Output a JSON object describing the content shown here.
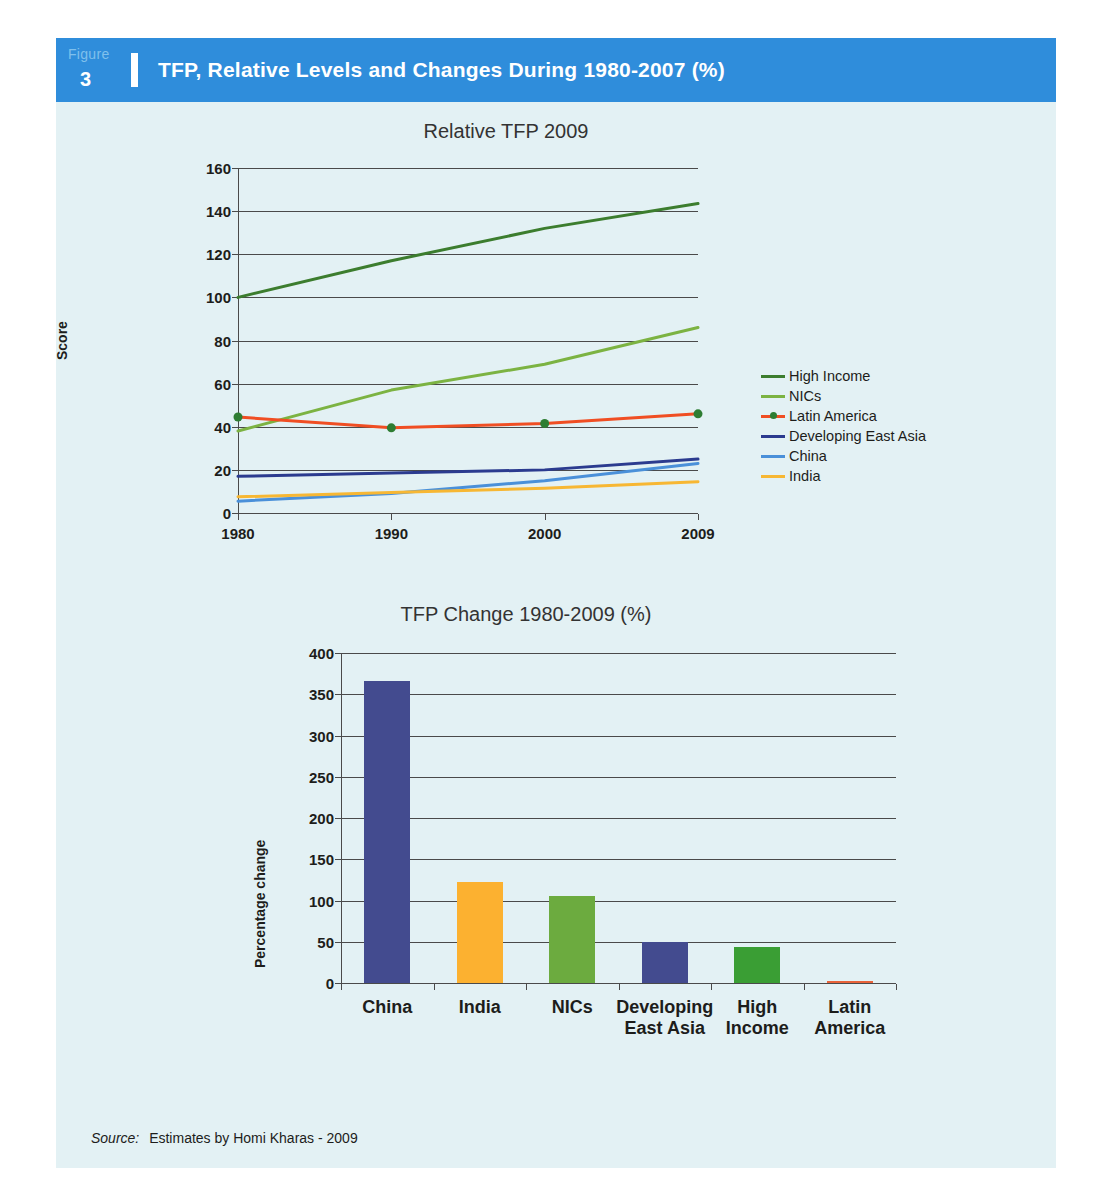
{
  "figure": {
    "label": "Figure",
    "number": "3",
    "title": "TFP, Relative Levels and Changes During 1980-2007 (%)"
  },
  "source": {
    "prefix": "Source:",
    "text": "Estimates by Homi Kharas - 2009"
  },
  "colors": {
    "header_blue": "#2f8ddb",
    "panel_bg": "#e3f1f4",
    "high_income": "#3c7d2e",
    "nics": "#7cb342",
    "latin_america": "#f04e23",
    "latin_america_marker": "#2e7d32",
    "developing_east_asia": "#2b3b8f",
    "china": "#4a90d9",
    "india": "#f7b733",
    "bar_china": "#434b8f",
    "bar_india": "#fcb130",
    "bar_nics": "#6cab3f",
    "bar_dev_east_asia": "#434b8f",
    "bar_high_income": "#3a9e34",
    "bar_latin_america": "#e8633a"
  },
  "chart_data": [
    {
      "type": "line",
      "title": "Relative TFP 2009",
      "xlabel": "",
      "ylabel": "Score",
      "x": [
        "1980",
        "1990",
        "2000",
        "2009"
      ],
      "ylim": [
        0,
        160
      ],
      "yticks": [
        0,
        20,
        40,
        60,
        80,
        100,
        120,
        140,
        160
      ],
      "grid": true,
      "legend_position": "right",
      "series": [
        {
          "name": "High Income",
          "values": [
            100,
            117,
            132,
            143.5
          ],
          "color": "#3c7d2e",
          "markers": false
        },
        {
          "name": "NICs",
          "values": [
            38,
            57,
            69,
            86
          ],
          "color": "#7cb342",
          "markers": false
        },
        {
          "name": "Latin America",
          "values": [
            44.5,
            39.5,
            41.5,
            46
          ],
          "color": "#f04e23",
          "markers": true
        },
        {
          "name": "Developing East Asia",
          "values": [
            17,
            18.5,
            20,
            25
          ],
          "color": "#2b3b8f",
          "markers": false
        },
        {
          "name": "China",
          "values": [
            5.5,
            9,
            15,
            23
          ],
          "color": "#4a90d9",
          "markers": false
        },
        {
          "name": "India",
          "values": [
            7.5,
            9.5,
            11.5,
            14.5
          ],
          "color": "#f7b733",
          "markers": false
        }
      ]
    },
    {
      "type": "bar",
      "title": "TFP Change 1980-2009 (%)",
      "xlabel": "",
      "ylabel": "Percentage change",
      "ylim": [
        0,
        400
      ],
      "yticks": [
        0,
        50,
        100,
        150,
        200,
        250,
        300,
        350,
        400
      ],
      "grid": true,
      "categories": [
        "China",
        "India",
        "NICs",
        "Developing East Asia",
        "High Income",
        "Latin America"
      ],
      "category_lines": [
        [
          "China"
        ],
        [
          "India"
        ],
        [
          "NICs"
        ],
        [
          "Developing",
          "East Asia"
        ],
        [
          "High",
          "Income"
        ],
        [
          "Latin",
          "America"
        ]
      ],
      "values": [
        366,
        123,
        106,
        50,
        44,
        3
      ],
      "bar_colors": [
        "#434b8f",
        "#fcb130",
        "#6cab3f",
        "#434b8f",
        "#3a9e34",
        "#e8633a"
      ]
    }
  ]
}
